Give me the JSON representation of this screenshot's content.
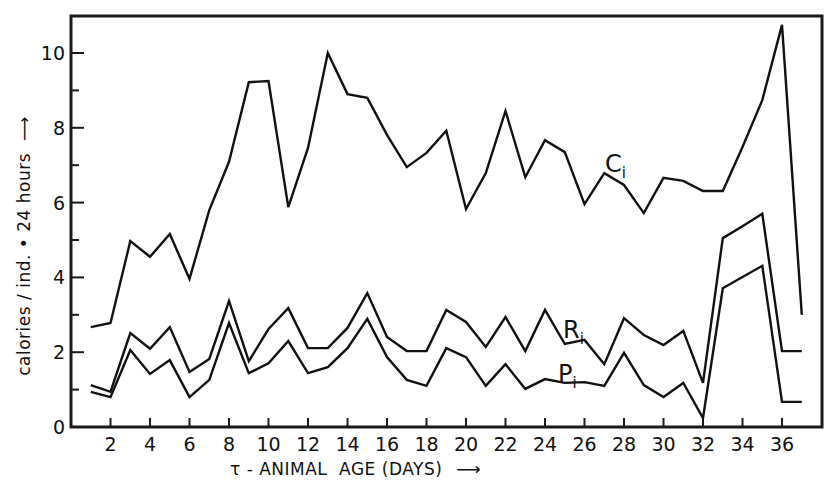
{
  "chart_data": {
    "type": "line",
    "title": "",
    "xlabel": "τ - ANIMAL  AGE (DAYS)",
    "xlabel_arrow": "⟶",
    "ylabel": "calories / ind. • 24 hours",
    "ylabel_arrow": "⟶",
    "xlim": [
      0,
      38
    ],
    "ylim": [
      0,
      11
    ],
    "x_ticks": [
      2,
      4,
      6,
      8,
      10,
      12,
      14,
      16,
      18,
      20,
      22,
      24,
      26,
      28,
      30,
      32,
      34,
      36
    ],
    "y_ticks_major": [
      0,
      2,
      4,
      6,
      8,
      10
    ],
    "y_ticks_minor": [
      1,
      3,
      5,
      7,
      9
    ],
    "grid": false,
    "legend_position": "inline labels",
    "x": [
      1,
      2,
      3,
      4,
      5,
      6,
      7,
      8,
      9,
      10,
      11,
      12,
      13,
      14,
      15,
      16,
      17,
      18,
      19,
      20,
      21,
      22,
      23,
      24,
      25,
      26,
      27,
      28,
      29,
      30,
      31,
      32,
      33,
      34,
      35,
      36,
      37
    ],
    "series": [
      {
        "name": "Ci",
        "label_main": "C",
        "label_sub": "i",
        "values": [
          2.67,
          2.78,
          4.97,
          4.55,
          5.16,
          3.96,
          5.8,
          7.09,
          9.22,
          9.25,
          5.88,
          7.46,
          10.0,
          8.9,
          8.8,
          7.81,
          6.95,
          7.33,
          7.92,
          5.83,
          6.79,
          8.45,
          6.68,
          7.67,
          7.35,
          5.96,
          6.79,
          6.47,
          5.72,
          6.66,
          6.58,
          6.31,
          6.31,
          7.49,
          8.74,
          10.75,
          3.0
        ],
        "label_pos": {
          "x": 605,
          "y": 172
        }
      },
      {
        "name": "Ri",
        "label_main": "R",
        "label_sub": "i",
        "values": [
          1.12,
          0.94,
          2.51,
          2.09,
          2.67,
          1.47,
          1.82,
          3.37,
          1.76,
          2.62,
          3.18,
          2.11,
          2.11,
          2.65,
          3.58,
          2.41,
          2.03,
          2.03,
          3.13,
          2.81,
          2.14,
          2.94,
          2.03,
          3.13,
          2.22,
          2.33,
          1.68,
          2.91,
          2.46,
          2.19,
          2.57,
          1.18,
          5.05,
          5.37,
          5.7,
          2.03,
          2.03
        ],
        "label_pos": {
          "x": 563,
          "y": 338
        }
      },
      {
        "name": "Pi",
        "label_main": "P",
        "label_sub": "i",
        "values": [
          0.94,
          0.8,
          2.06,
          1.42,
          1.79,
          0.8,
          1.26,
          2.78,
          1.44,
          1.7,
          2.3,
          1.44,
          1.6,
          2.11,
          2.89,
          1.87,
          1.26,
          1.1,
          2.11,
          1.87,
          1.1,
          1.68,
          1.02,
          1.28,
          1.18,
          1.2,
          1.1,
          1.98,
          1.12,
          0.8,
          1.18,
          0.24,
          3.71,
          4.01,
          4.31,
          0.67,
          0.67
        ],
        "label_pos": {
          "x": 558,
          "y": 382
        }
      }
    ]
  }
}
